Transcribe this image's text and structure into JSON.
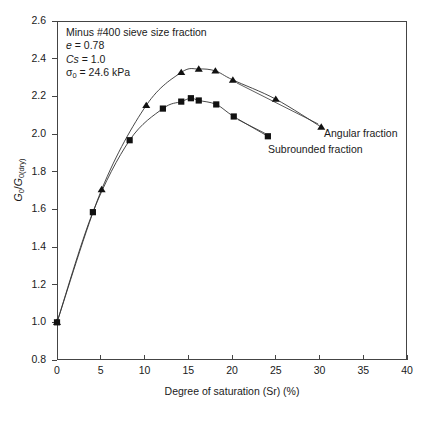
{
  "chart_data": {
    "type": "scatter",
    "title": "",
    "xlabel": "Degree of saturation (Sr) (%)",
    "ylabel": "G0/G0(dry)",
    "ylabel_parts": {
      "numerator": "G",
      "num_sub": "0",
      "denominator": "G",
      "den_sub": "0(dry)"
    },
    "xlim": [
      0,
      40
    ],
    "ylim": [
      0.8,
      2.6
    ],
    "xticks": [
      0,
      5,
      10,
      15,
      20,
      25,
      30,
      35,
      40
    ],
    "yticks": [
      "0.8",
      "1.0",
      "1.2",
      "1.4",
      "1.6",
      "1.8",
      "2.0",
      "2.2",
      "2.4",
      "2.6"
    ],
    "grid": false,
    "legend_position": "inline-annotation",
    "annotations": [
      "Minus #400 sieve size fraction",
      "e = 0.78",
      "Cs = 1.0",
      "σ0 = 24.6 kPa"
    ],
    "annotation_lines": [
      {
        "id": "sieve",
        "plain": "Minus #400 sieve size fraction",
        "italic_prefix": "",
        "rest": "Minus #400 sieve size fraction"
      },
      {
        "id": "void-ratio",
        "symbol": "e",
        "value": " = 0.78"
      },
      {
        "id": "cs",
        "symbol": "Cs",
        "value": " = 1.0"
      },
      {
        "id": "sigma",
        "symbol": "σ",
        "sub": "0",
        "value": " = 24.6 kPa"
      }
    ],
    "series": [
      {
        "name": "Angular fraction",
        "marker": "triangle",
        "label": "Angular fraction",
        "points": [
          {
            "x": 0.0,
            "y": 1.0
          },
          {
            "x": 5.1,
            "y": 1.705
          },
          {
            "x": 10.2,
            "y": 2.152
          },
          {
            "x": 14.2,
            "y": 2.327
          },
          {
            "x": 16.2,
            "y": 2.345
          },
          {
            "x": 18.1,
            "y": 2.335
          },
          {
            "x": 20.1,
            "y": 2.287
          },
          {
            "x": 25.0,
            "y": 2.185
          },
          {
            "x": 30.2,
            "y": 2.037
          }
        ]
      },
      {
        "name": "Subrounded fraction",
        "marker": "square",
        "label": "Subrounded fraction",
        "points": [
          {
            "x": 0.0,
            "y": 1.0
          },
          {
            "x": 4.1,
            "y": 1.585
          },
          {
            "x": 8.3,
            "y": 1.967
          },
          {
            "x": 12.1,
            "y": 2.135
          },
          {
            "x": 14.2,
            "y": 2.172
          },
          {
            "x": 15.3,
            "y": 2.19
          },
          {
            "x": 16.2,
            "y": 2.178
          },
          {
            "x": 18.2,
            "y": 2.157
          },
          {
            "x": 20.2,
            "y": 2.093
          },
          {
            "x": 24.1,
            "y": 1.988
          }
        ]
      }
    ]
  },
  "caption_fragment": ""
}
